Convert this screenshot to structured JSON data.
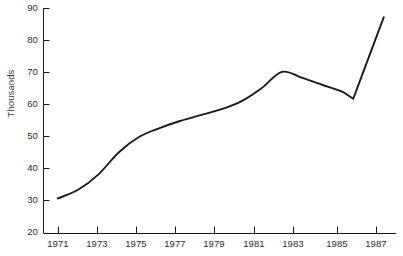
{
  "chart_data": {
    "type": "line",
    "title": "",
    "subtitle": "",
    "xlabel": "",
    "ylabel": "Thousands",
    "xlim": [
      1970.3,
      1987.6
    ],
    "ylim": [
      20,
      90
    ],
    "grid": false,
    "legend": null,
    "legend_position": "none",
    "y_ticks": [
      20,
      30,
      40,
      50,
      60,
      70,
      80,
      90
    ],
    "y_tick_labels": [
      "20",
      "30",
      "40",
      "50",
      "60",
      "70",
      "80",
      "90"
    ],
    "x_ticks": [
      1971,
      1973,
      1975,
      1977,
      1979,
      1981,
      1983,
      1985,
      1987
    ],
    "x_tick_labels": [
      "1971",
      "1973",
      "1975",
      "1977",
      "1979",
      "1981",
      "1983",
      "1985",
      "1987"
    ],
    "series": [
      {
        "name": "value",
        "color": "#1a1a1a",
        "x": [
          1971,
          1972,
          1973,
          1974,
          1975,
          1976,
          1977,
          1978,
          1979,
          1980,
          1981,
          1982,
          1983,
          1984,
          1985,
          1985.5,
          1987
        ],
        "values": [
          30.9,
          33.6,
          38.4,
          45.3,
          50.1,
          52.8,
          55.0,
          56.8,
          58.6,
          61.1,
          65.2,
          70.3,
          68.4,
          66.2,
          64.0,
          61.9,
          87.3
        ]
      }
    ],
    "annotations": []
  },
  "axis": {
    "y_label": "Thousands"
  },
  "caption": {
    "text": ""
  }
}
